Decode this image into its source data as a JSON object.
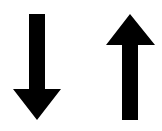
{
  "canvas": {
    "width": 162,
    "height": 131,
    "background": "#ffffff"
  },
  "icons": [
    {
      "name": "arrow-down-icon",
      "direction": "down",
      "color": "#000000"
    },
    {
      "name": "arrow-up-icon",
      "direction": "up",
      "color": "#000000"
    }
  ]
}
